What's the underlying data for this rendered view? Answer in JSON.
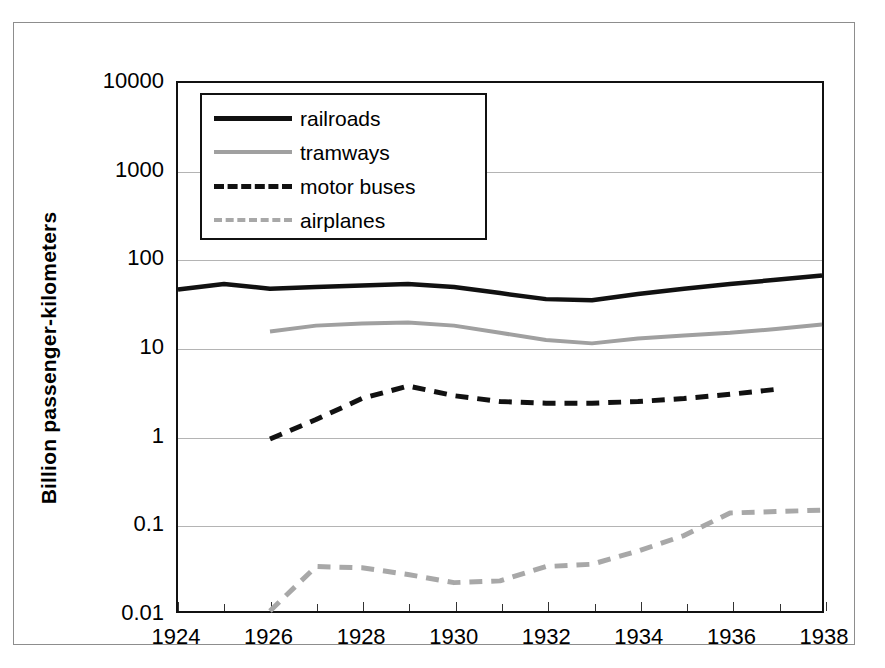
{
  "chart_data": {
    "type": "line",
    "title": "",
    "xlabel": "",
    "ylabel": "Billion passenger-kilometers",
    "yscale": "log",
    "ylim": [
      0.01,
      10000
    ],
    "xlim": [
      1924,
      1938
    ],
    "grid": true,
    "legend_position": "upper left",
    "ytick_labels": [
      "10000",
      "1000",
      "100",
      "10",
      "1",
      "0.1",
      "0.01"
    ],
    "ytick_values": [
      10000,
      1000,
      100,
      10,
      1,
      0.1,
      0.01
    ],
    "xtick_labels": [
      "1924",
      "1926",
      "1928",
      "1930",
      "1932",
      "1934",
      "1936",
      "1938"
    ],
    "xtick_values": [
      1924,
      1926,
      1928,
      1930,
      1932,
      1934,
      1936,
      1938
    ],
    "series": [
      {
        "name": "railroads",
        "style": "solid",
        "color": "#111111",
        "x": [
          1924,
          1925,
          1926,
          1927,
          1928,
          1929,
          1930,
          1931,
          1932,
          1933,
          1934,
          1935,
          1936,
          1937,
          1938
        ],
        "values": [
          45,
          52,
          46,
          48,
          50,
          52,
          48,
          41,
          35,
          34,
          40,
          46,
          52,
          58,
          65
        ]
      },
      {
        "name": "tramways",
        "style": "solid",
        "color": "#a0a0a0",
        "x": [
          1926,
          1927,
          1928,
          1929,
          1930,
          1931,
          1932,
          1933,
          1934,
          1935,
          1936,
          1937,
          1938
        ],
        "values": [
          15,
          17.5,
          18.5,
          19,
          17.5,
          14.5,
          12,
          11,
          12.5,
          13.5,
          14.5,
          16,
          18
        ]
      },
      {
        "name": "motor buses",
        "style": "dashed",
        "color": "#111111",
        "x": [
          1926,
          1927,
          1928,
          1929,
          1930,
          1931,
          1932,
          1933,
          1934,
          1935,
          1936,
          1937
        ],
        "values": [
          0.9,
          1.5,
          2.6,
          3.6,
          2.8,
          2.4,
          2.3,
          2.3,
          2.4,
          2.6,
          2.9,
          3.3
        ]
      },
      {
        "name": "airplanes",
        "style": "dashed",
        "color": "#a8a8a8",
        "x": [
          1926,
          1927,
          1928,
          1929,
          1930,
          1931,
          1932,
          1933,
          1934,
          1935,
          1936,
          1937,
          1938
        ],
        "values": [
          0.01,
          0.032,
          0.031,
          0.026,
          0.021,
          0.022,
          0.032,
          0.034,
          0.048,
          0.072,
          0.13,
          0.135,
          0.14
        ]
      }
    ]
  },
  "legend": {
    "items": [
      {
        "label": "railroads"
      },
      {
        "label": "tramways"
      },
      {
        "label": "motor buses"
      },
      {
        "label": "airplanes"
      }
    ]
  }
}
